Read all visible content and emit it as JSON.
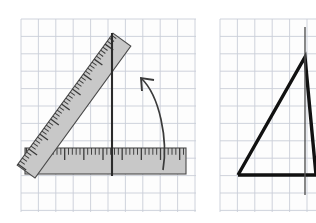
{
  "figure": {
    "canvas": {
      "width": 316,
      "height": 223,
      "background": "#ffffff"
    },
    "grid": {
      "cell_size": 17.4,
      "line_color": "#c9ced8",
      "line_width": 0.9,
      "background": "#fdfdfd"
    },
    "colors": {
      "ruler_fill": "#c8c8c8",
      "ruler_stroke": "#4a4a4a",
      "tick_color": "#3a3a3a",
      "line_stroke": "#2b2b2b",
      "triangle_stroke": "#111111",
      "arrow_stroke": "#3a3a3a",
      "thin_axis": "#555555"
    },
    "panels": [
      {
        "name": "left-panel",
        "label": "ruler-measurement-panel",
        "grid_rect": {
          "x": 21,
          "y": 19,
          "width": 175,
          "height": 193
        },
        "elements": [
          {
            "name": "horizontal-ruler",
            "type": "ruler",
            "orientation": "horizontal",
            "x": 25,
            "y": 174,
            "length": 161,
            "thickness": 26,
            "rotation": 0,
            "tick_count": 42,
            "major_every": 5
          },
          {
            "name": "diagonal-ruler",
            "type": "ruler",
            "orientation": "diagonal",
            "x": 35,
            "y": 178,
            "length": 163,
            "thickness": 22,
            "rotation": -54,
            "tick_count": 44,
            "major_every": 5
          },
          {
            "name": "vertical-reference-line",
            "type": "line",
            "x1": 112,
            "y1": 33,
            "x2": 112,
            "y2": 176,
            "width": 2.1
          },
          {
            "name": "rotation-arrow",
            "type": "curved-arrow",
            "path": "M 163 170 C 168 140 160 96 141 78",
            "arrow_tip": {
              "x": 141,
              "y": 78
            },
            "direction": "counter-clockwise-up-left"
          }
        ]
      },
      {
        "name": "right-panel",
        "label": "triangle-result-panel",
        "grid_rect": {
          "x": 220,
          "y": 19,
          "width": 96,
          "height": 193
        },
        "elements": [
          {
            "name": "triangle-outline",
            "type": "polyline",
            "points": [
              {
                "x": 238,
                "y": 175
              },
              {
                "x": 305,
                "y": 57
              },
              {
                "x": 316,
                "y": 175
              }
            ],
            "base_y": 175,
            "apex": {
              "x": 305,
              "y": 57
            },
            "stroke_width": 3.4
          },
          {
            "name": "vertical-axis-line",
            "type": "line",
            "x1": 305,
            "y1": 27,
            "x2": 305,
            "y2": 195,
            "width": 1.4
          }
        ]
      }
    ]
  }
}
